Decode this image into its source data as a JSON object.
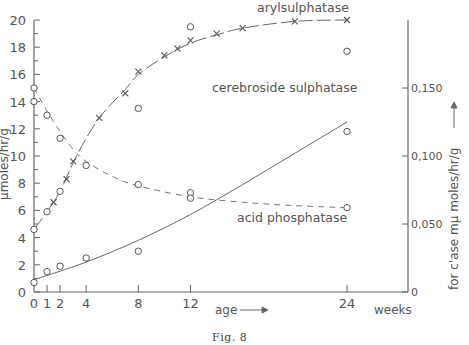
{
  "figure": {
    "caption": "Fig. 8",
    "x_label": "age",
    "x_unit": "weeks",
    "left_y_label": "μmoles/hr/g",
    "right_y_label": "for c'ase mμ moles/hr/g",
    "left_y_ticks": [
      "0",
      "2",
      "4",
      "6",
      "8",
      "10",
      "12",
      "14",
      "16",
      "18",
      "20"
    ],
    "right_y_ticks": [
      "0",
      "0,050",
      "0,100",
      "0,150"
    ],
    "x_ticks": [
      "0",
      "1",
      "2",
      "4",
      "8",
      "12",
      "24"
    ],
    "labels": {
      "arylsulphatase": "arylsulphatase",
      "cerebroside": "cerebroside sulphatase",
      "acid_phosphatase": "acid phosphatase"
    }
  },
  "chart_data": {
    "type": "line",
    "title": "Fig. 8",
    "xlabel": "age (weeks)",
    "ylabel": "μmoles/hr/g",
    "y2label": "for c'ase mμ moles/hr/g",
    "xlim": [
      0,
      24
    ],
    "ylim": [
      0,
      20
    ],
    "y2lim": [
      0,
      0.2
    ],
    "x_ticks": [
      0,
      1,
      2,
      4,
      8,
      12,
      24
    ],
    "y_ticks": [
      0,
      2,
      4,
      6,
      8,
      10,
      12,
      14,
      16,
      18,
      20
    ],
    "y2_ticks": [
      0,
      0.05,
      0.1,
      0.15
    ],
    "grid": false,
    "series": [
      {
        "name": "arylsulphatase",
        "style": "long-dash line with x markers",
        "curve": [
          [
            0,
            4.6
          ],
          [
            1,
            5.9
          ],
          [
            2,
            7.4
          ],
          [
            3,
            9.5
          ],
          [
            4,
            11.3
          ],
          [
            5,
            12.8
          ],
          [
            6,
            13.9
          ],
          [
            7,
            14.9
          ],
          [
            8,
            16.0
          ],
          [
            10,
            17.3
          ],
          [
            12,
            18.3
          ],
          [
            14,
            18.9
          ],
          [
            16,
            19.4
          ],
          [
            20,
            19.9
          ],
          [
            24,
            20.0
          ]
        ],
        "x_markers": [
          [
            1.5,
            6.6
          ],
          [
            2.5,
            8.3
          ],
          [
            3,
            9.6
          ],
          [
            5,
            12.8
          ],
          [
            7,
            14.6
          ],
          [
            8,
            16.2
          ],
          [
            10,
            17.4
          ],
          [
            11,
            17.9
          ],
          [
            12,
            18.5
          ],
          [
            14,
            19.0
          ],
          [
            16,
            19.4
          ],
          [
            20,
            19.9
          ],
          [
            24,
            20.0
          ]
        ],
        "circle_points": [
          [
            0,
            4.6
          ],
          [
            1,
            5.9
          ],
          [
            2,
            7.4
          ],
          [
            8,
            13.5
          ],
          [
            12,
            19.5
          ],
          [
            24,
            17.7
          ]
        ]
      },
      {
        "name": "acid phosphatase",
        "style": "short-dash line with circle markers",
        "points": [
          [
            0,
            15.0
          ],
          [
            0,
            14.0
          ],
          [
            1,
            13.0
          ],
          [
            2,
            11.3
          ],
          [
            4,
            9.3
          ],
          [
            8,
            7.9
          ],
          [
            12,
            7.3
          ],
          [
            12,
            6.9
          ],
          [
            24,
            6.2
          ]
        ],
        "curve": [
          [
            0,
            15.0
          ],
          [
            1,
            13.3
          ],
          [
            2,
            11.8
          ],
          [
            3,
            10.5
          ],
          [
            4,
            9.6
          ],
          [
            6,
            8.5
          ],
          [
            8,
            7.8
          ],
          [
            12,
            7.0
          ],
          [
            16,
            6.6
          ],
          [
            20,
            6.35
          ],
          [
            24,
            6.2
          ]
        ]
      },
      {
        "name": "cerebroside sulphatase",
        "axis": "right",
        "style": "solid line with circle markers",
        "points": [
          [
            0,
            0.7
          ],
          [
            1,
            1.5
          ],
          [
            2,
            1.9
          ],
          [
            4,
            2.5
          ],
          [
            8,
            3.0
          ],
          [
            24,
            11.8
          ]
        ],
        "curve": [
          [
            0,
            0.9
          ],
          [
            4,
            2.2
          ],
          [
            8,
            3.8
          ],
          [
            12,
            5.7
          ],
          [
            16,
            7.9
          ],
          [
            20,
            10.2
          ],
          [
            24,
            12.5
          ]
        ]
      }
    ]
  }
}
